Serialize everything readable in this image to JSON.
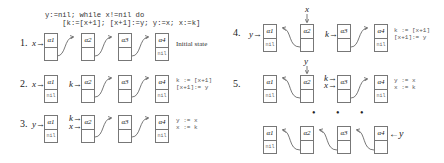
{
  "program": {
    "line1": "y:=nil; while x!=nil do",
    "line2": "    [k:=[x+1]; [x+1]:=y; y:=x; x:=k]"
  },
  "node_labels": [
    "α1",
    "α2",
    "α3",
    "α4"
  ],
  "nil_label": "nil",
  "steps": [
    {
      "number": "1.",
      "caption": "Initial state",
      "pointers": {
        "a1": "x→"
      }
    },
    {
      "number": "2.",
      "pointers": {
        "a1": "x→",
        "a2": "k→"
      },
      "note": "k := [x+1]\n[x+1]:= y"
    },
    {
      "number": "3.",
      "pointers": {
        "a1": "y→",
        "a2_top": "k→",
        "a2_bottom": "x→"
      },
      "note": "y := x\nx := k"
    },
    {
      "number": "4.",
      "pointers": {
        "a1": "y→",
        "a2_above": "x",
        "a3": "k→"
      },
      "note": "k := [x+1]\n[x+1]:= y"
    },
    {
      "number": "5.",
      "pointers": {
        "a2_above": "y",
        "a3_top": "k→",
        "a3_bottom": "x→"
      },
      "note": "y := x\nx := k"
    },
    {
      "number": "",
      "ellipsis": "• • •",
      "pointers": {
        "a4_right": "←y"
      }
    }
  ]
}
